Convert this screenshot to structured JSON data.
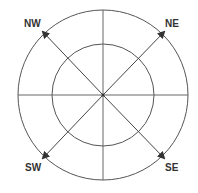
{
  "diagram": {
    "type": "compass-rose",
    "center": [
      103,
      95
    ],
    "outer_radius": 85,
    "inner_radius": 51,
    "line_color": "#444444",
    "labels": {
      "nw": "NW",
      "ne": "NE",
      "sw": "SW",
      "se": "SE"
    },
    "arrows": [
      {
        "direction": "NW",
        "tip": [
          43,
          32
        ]
      },
      {
        "direction": "NE",
        "tip": [
          164,
          32
        ]
      },
      {
        "direction": "SW",
        "tip": [
          43,
          158
        ]
      },
      {
        "direction": "SE",
        "tip": [
          164,
          158
        ]
      }
    ]
  }
}
